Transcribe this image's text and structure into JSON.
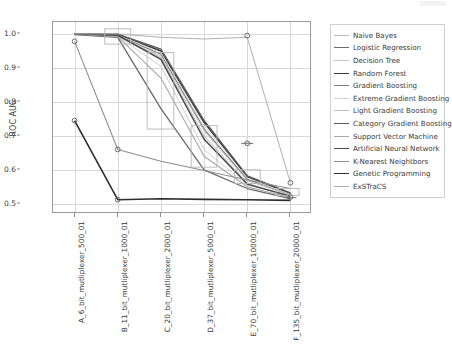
{
  "chart_data": {
    "type": "line",
    "title": "",
    "xlabel": "",
    "ylabel": "ROC AUC",
    "ylim": [
      0.47,
      1.035
    ],
    "yticks": [
      0.5,
      0.6,
      0.7,
      0.8,
      0.9,
      1.0
    ],
    "ytick_labels": [
      "0.5",
      "0.6",
      "0.7",
      "0.8",
      "0.9",
      "1.0"
    ],
    "grid": true,
    "legend_position": "right-outside",
    "categories": [
      "A_6_bit_mutliplexer_500_01",
      "B_11_bit_mutliplexer_1000_01",
      "C_20_bit_mutliplexer_2000_01",
      "D_37_bit_mutliplexer_5000_01",
      "E_70_bit_mutliplexer_10000_01",
      "F_135_bit_mutliplexer_20000_01"
    ],
    "series": [
      {
        "name": "Naive Bayes",
        "color": "#b9b9b9",
        "width": 1.0,
        "values": [
          1.0,
          0.995,
          0.93,
          0.7,
          0.56,
          0.52
        ]
      },
      {
        "name": "Logistic Regression",
        "color": "#6a6a6a",
        "width": 1.3,
        "values": [
          0.998,
          0.99,
          0.78,
          0.6,
          0.545,
          0.515
        ]
      },
      {
        "name": "Decision Tree",
        "color": "#c8c8c8",
        "width": 0.9,
        "values": [
          1.0,
          0.993,
          0.905,
          0.66,
          0.555,
          0.525
        ]
      },
      {
        "name": "Random Forest",
        "color": "#3b3b3b",
        "width": 1.6,
        "values": [
          1.0,
          0.998,
          0.95,
          0.74,
          0.58,
          0.53
        ]
      },
      {
        "name": "Gradient Boosting",
        "color": "#7d7d7d",
        "width": 1.2,
        "values": [
          1.0,
          0.996,
          0.94,
          0.72,
          0.572,
          0.527
        ]
      },
      {
        "name": "Extreme Gradient Boosting",
        "color": "#d2d2d2",
        "width": 0.9,
        "values": [
          1.0,
          0.997,
          0.945,
          0.73,
          0.575,
          0.528
        ]
      },
      {
        "name": "Light Gradient Boosting",
        "color": "#c0c0c0",
        "width": 1.0,
        "values": [
          1.0,
          0.994,
          0.935,
          0.715,
          0.568,
          0.526
        ]
      },
      {
        "name": "Category Gradient Boosting",
        "color": "#5a5a5a",
        "width": 1.4,
        "values": [
          1.0,
          0.999,
          0.955,
          0.745,
          0.582,
          0.532
        ]
      },
      {
        "name": "Support Vector Machine",
        "color": "#a8a8a8",
        "width": 1.1,
        "values": [
          1.0,
          0.992,
          0.87,
          0.64,
          0.55,
          0.518
        ]
      },
      {
        "name": "Artificial Neural Network",
        "color": "#4a4a4a",
        "width": 1.5,
        "values": [
          1.0,
          0.996,
          0.925,
          0.69,
          0.558,
          0.522
        ]
      },
      {
        "name": "K-Nearest Neightbors",
        "color": "#8f8f8f",
        "width": 1.1,
        "values": [
          0.978,
          0.66,
          0.625,
          0.598,
          0.57,
          0.545
        ]
      },
      {
        "name": "Genetic Programming",
        "color": "#2e2e2e",
        "width": 1.6,
        "values": [
          0.745,
          0.512,
          0.515,
          0.513,
          0.512,
          0.51
        ]
      },
      {
        "name": "ExSTraCS",
        "color": "#b0b0b0",
        "width": 1.0,
        "values": [
          1.0,
          1.0,
          0.99,
          0.985,
          0.99,
          0.562
        ]
      }
    ],
    "outlier_markers": [
      {
        "x": 0,
        "y": 0.978
      },
      {
        "x": 0,
        "y": 0.745
      },
      {
        "x": 1,
        "y": 0.66
      },
      {
        "x": 1,
        "y": 0.512
      },
      {
        "x": 4,
        "y": 0.995
      },
      {
        "x": 4,
        "y": 0.678
      },
      {
        "x": 5,
        "y": 0.562
      },
      {
        "x": 5,
        "y": 0.52
      }
    ],
    "boxes": [
      {
        "x": 1,
        "q1": 0.97,
        "q3": 1.015,
        "x_lo": -0.3,
        "x_hi": 0.3
      },
      {
        "x": 2,
        "q1": 0.72,
        "q3": 0.945,
        "x_lo": -0.32,
        "x_hi": 0.3
      },
      {
        "x": 3,
        "q1": 0.608,
        "q3": 0.73,
        "x_lo": -0.3,
        "x_hi": 0.3
      },
      {
        "x": 4,
        "q1": 0.56,
        "q3": 0.6,
        "x_lo": -0.3,
        "x_hi": 0.3
      },
      {
        "x": 5,
        "q1": 0.525,
        "q3": 0.545,
        "x_lo": -0.34,
        "x_hi": 0.2
      }
    ],
    "whiskers": [
      {
        "x": 4,
        "y": 0.678,
        "half_width": 0.14
      },
      {
        "x": 5,
        "y": 0.518,
        "half_width": 0.14
      }
    ]
  }
}
